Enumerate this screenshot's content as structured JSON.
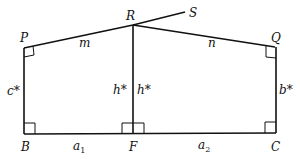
{
  "diagram": {
    "points": {
      "P": {
        "label": "P",
        "x": 24,
        "y": 48
      },
      "R": {
        "label": "R",
        "x": 133,
        "y": 25
      },
      "S": {
        "label": "S",
        "x": 185,
        "y": 12
      },
      "Q": {
        "label": "Q",
        "x": 275,
        "y": 47
      },
      "B": {
        "label": "B",
        "x": 24,
        "y": 134
      },
      "F": {
        "label": "F",
        "x": 133,
        "y": 134
      },
      "C": {
        "label": "C",
        "x": 276,
        "y": 133
      }
    },
    "segment_labels": {
      "m": "m",
      "n": "n",
      "c_star": "c*",
      "h_star_left": "h*",
      "h_star_right": "h*",
      "b_star": "b*",
      "a1_base": "a",
      "a1_sub": "1",
      "a2_base": "a",
      "a2_sub": "2"
    },
    "right_angles": [
      "P",
      "Q",
      "B",
      "F-left",
      "F-right",
      "C"
    ]
  }
}
